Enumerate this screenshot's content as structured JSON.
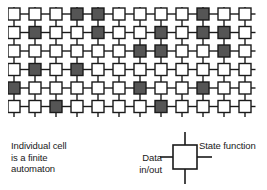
{
  "figure": {
    "background_color": "#ffffff"
  },
  "grid": {
    "columns": 12,
    "rows": 6,
    "cell_size": 12,
    "pitch_x": 21,
    "pitch_y": 18.5,
    "cell_fill_empty": "#ffffff",
    "cell_fill_active": "#555555",
    "cell_stroke": "#1a1a1a",
    "connector_color": "#1a1a1a",
    "active_cells": [
      [
        1,
        4
      ],
      [
        1,
        5
      ],
      [
        1,
        10
      ],
      [
        2,
        2
      ],
      [
        2,
        5
      ],
      [
        2,
        8
      ],
      [
        2,
        10
      ],
      [
        2,
        11
      ],
      [
        3,
        7
      ],
      [
        3,
        8
      ],
      [
        3,
        11
      ],
      [
        4,
        2
      ],
      [
        4,
        4
      ],
      [
        5,
        1
      ],
      [
        5,
        7
      ],
      [
        5,
        10
      ],
      [
        6,
        3
      ],
      [
        6,
        8
      ]
    ]
  },
  "captions": {
    "cell_description": "Individual cell\nis a finite\nautomaton",
    "data_label": "Data\nin/out",
    "state_label": "State function"
  },
  "legend": {
    "symbol_name": "automaton-cell-symbol",
    "stroke_color": "#1a1a1a",
    "fill_color": "#ffffff"
  }
}
